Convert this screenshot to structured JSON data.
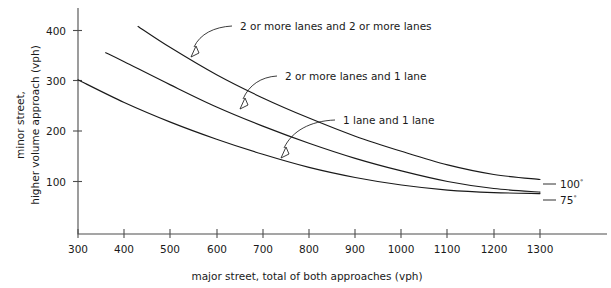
{
  "chart_data": {
    "type": "line",
    "title": "",
    "xlabel": "major street, total of both approaches (vph)",
    "ylabel_line1": "minor street,",
    "ylabel_line2": "higher volume approach (vph)",
    "xlim": [
      300,
      1325
    ],
    "ylim": [
      40,
      430
    ],
    "xticks": [
      300,
      400,
      500,
      600,
      700,
      800,
      900,
      1000,
      1100,
      1200,
      1300
    ],
    "yticks": [
      100,
      200,
      300,
      400
    ],
    "grid": false,
    "legend_position": "inline-annotations",
    "series": [
      {
        "name": "2 or more lanes and 2 or more lanes",
        "x": [
          430,
          500,
          600,
          700,
          800,
          900,
          1000,
          1100,
          1200,
          1300
        ],
        "y": [
          408,
          366,
          312,
          266,
          226,
          190,
          160,
          133,
          114,
          104
        ]
      },
      {
        "name": "2 or more lanes and 1 lane",
        "x": [
          360,
          400,
          500,
          600,
          700,
          800,
          900,
          1000,
          1100,
          1200,
          1300
        ],
        "y": [
          356,
          338,
          292,
          248,
          210,
          176,
          146,
          121,
          100,
          86,
          79
        ]
      },
      {
        "name": "1 lane and 1 lane",
        "x": [
          300,
          400,
          500,
          600,
          700,
          800,
          900,
          1000,
          1100,
          1200,
          1300
        ],
        "y": [
          302,
          257,
          218,
          184,
          154,
          128,
          108,
          93,
          83,
          78,
          76
        ]
      }
    ],
    "annotations": [
      {
        "text": "2 or more lanes and 2 or more lanes",
        "points_to_series": "2 or more lanes and 2 or more lanes"
      },
      {
        "text": "2 or more lanes and 1 lane",
        "points_to_series": "2 or more lanes and 1 lane"
      },
      {
        "text": "1 lane and 1 lane",
        "points_to_series": "1 lane and 1 lane"
      }
    ],
    "end_labels": [
      {
        "value": "100",
        "mark": "°"
      },
      {
        "value": "75",
        "mark": "°"
      }
    ]
  },
  "colors": {
    "background": "#ffffff",
    "ink": "#1a1a1a",
    "axis": "#4d4d4d"
  }
}
